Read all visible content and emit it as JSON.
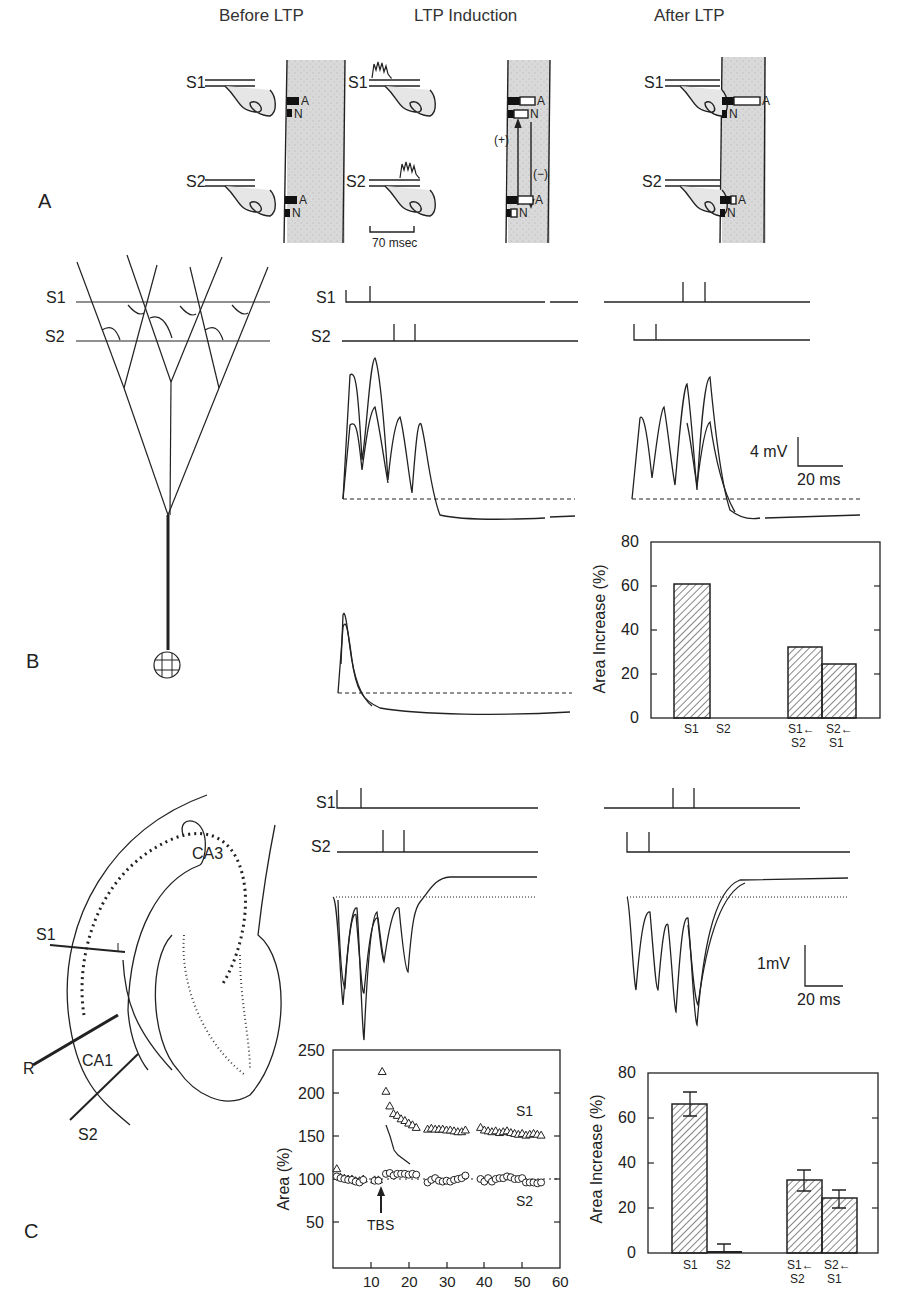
{
  "panel_a": {
    "letter": "A",
    "titles": [
      "Before LTP",
      "LTP Induction",
      "After LTP"
    ],
    "inputs": [
      "S1",
      "S2"
    ],
    "receptors": [
      "A",
      "N"
    ],
    "arrow_plus": "(+)",
    "arrow_minus": "(−)",
    "scale_label": "70 msec"
  },
  "panel_b": {
    "letter": "B",
    "neuron_inputs": [
      "S1",
      "S2"
    ],
    "trace_labels": [
      "S1",
      "S2"
    ],
    "scale_v": "4 mV",
    "scale_t": "20 ms"
  },
  "panel_c": {
    "letter": "C",
    "slice_labels": {
      "s1": "S1",
      "s2": "S2",
      "r": "R",
      "ca1": "CA1",
      "ca3": "CA3"
    },
    "trace_labels": [
      "S1",
      "S2"
    ],
    "scale_v": "1mV",
    "scale_t": "20 ms",
    "tbs_label": "TBS"
  },
  "chart_data": [
    {
      "type": "bar",
      "panel": "B",
      "ylabel": "Area Increase (%)",
      "ylim": [
        0,
        80
      ],
      "yticks": [
        "0",
        "20",
        "40",
        "60",
        "80"
      ],
      "categories": [
        "S1",
        "S2",
        "S1← S2",
        "S2← S1"
      ],
      "category_lines": [
        [
          "S1"
        ],
        [
          "S2"
        ],
        [
          "S1←",
          "S2"
        ],
        [
          "S2←",
          "S1"
        ]
      ],
      "values": [
        61,
        0,
        32,
        24
      ],
      "pattern": "hatched"
    },
    {
      "type": "scatter",
      "panel": "C",
      "ylabel": "Area (%)",
      "xlabel": "",
      "xlim": [
        0,
        60
      ],
      "ylim": [
        0,
        250
      ],
      "xticks": [
        "10",
        "20",
        "30",
        "40",
        "50",
        "60"
      ],
      "yticks": [
        "50",
        "100",
        "150",
        "200",
        "250"
      ],
      "annotation": "TBS",
      "annotation_x": 13,
      "series": [
        {
          "name": "S1",
          "marker": "triangle",
          "x": [
            1,
            2,
            3,
            4,
            5,
            6,
            7,
            8,
            11,
            12,
            13,
            14,
            15,
            16,
            17,
            18,
            19,
            20,
            21,
            22,
            25,
            26,
            27,
            28,
            29,
            30,
            31,
            32,
            33,
            34,
            35,
            39,
            40,
            41,
            42,
            43,
            44,
            45,
            46,
            47,
            48,
            49,
            50,
            51,
            52,
            53,
            54,
            55
          ],
          "y": [
            112,
            102,
            101,
            100,
            100,
            98,
            98,
            100,
            99,
            99,
            225,
            202,
            185,
            176,
            174,
            170,
            168,
            165,
            163,
            160,
            158,
            159,
            158,
            158,
            158,
            157,
            157,
            156,
            155,
            155,
            157,
            160,
            157,
            156,
            155,
            156,
            154,
            155,
            156,
            154,
            153,
            152,
            153,
            151,
            152,
            153,
            152,
            151
          ]
        },
        {
          "name": "S2",
          "marker": "circle",
          "x": [
            1,
            2,
            3,
            4,
            5,
            6,
            7,
            8,
            11,
            12,
            14,
            15,
            16,
            17,
            18,
            19,
            20,
            21,
            22,
            25,
            26,
            27,
            28,
            29,
            30,
            31,
            32,
            33,
            34,
            35,
            39,
            40,
            41,
            42,
            43,
            44,
            45,
            46,
            47,
            48,
            49,
            50,
            51,
            52,
            53,
            54,
            55
          ],
          "y": [
            103,
            101,
            100,
            99,
            99,
            97,
            96,
            99,
            98,
            98,
            106,
            107,
            104,
            106,
            106,
            106,
            105,
            106,
            105,
            96,
            99,
            101,
            98,
            97,
            98,
            97,
            99,
            100,
            101,
            104,
            100,
            97,
            101,
            97,
            100,
            101,
            101,
            103,
            102,
            100,
            100,
            101,
            96,
            96,
            96,
            95,
            96
          ]
        }
      ],
      "reference_line": 100
    },
    {
      "type": "bar",
      "panel": "C",
      "ylabel": "Area Increase (%)",
      "ylim": [
        0,
        80
      ],
      "yticks": [
        "0",
        "20",
        "40",
        "60",
        "80"
      ],
      "categories": [
        "S1",
        "S2",
        "S1← S2",
        "S2← S1"
      ],
      "category_lines": [
        [
          "S1"
        ],
        [
          "S2"
        ],
        [
          "S1←",
          "S2"
        ],
        [
          "S2←",
          "S1"
        ]
      ],
      "values": [
        66,
        1,
        32,
        24
      ],
      "errors": [
        5,
        3,
        5,
        4
      ],
      "pattern": "hatched"
    }
  ]
}
